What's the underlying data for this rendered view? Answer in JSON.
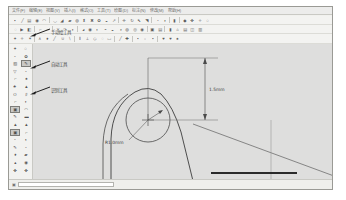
{
  "window": {
    "title": "CAD Drawing Window"
  },
  "menubar": {
    "items": [
      {
        "label": "文件(F)",
        "name": "menu-file"
      },
      {
        "label": "编辑(E)",
        "name": "menu-edit"
      },
      {
        "label": "视图(V)",
        "name": "menu-view"
      },
      {
        "label": "插入(I)",
        "name": "menu-insert"
      },
      {
        "label": "格式(O)",
        "name": "menu-format"
      },
      {
        "label": "工具(T)",
        "name": "menu-tools"
      },
      {
        "label": "绘图(D)",
        "name": "menu-draw"
      },
      {
        "label": "标注(N)",
        "name": "menu-dimension"
      },
      {
        "label": "修改(M)",
        "name": "menu-modify"
      },
      {
        "label": "帮助(H)",
        "name": "menu-help"
      }
    ]
  },
  "toolbars": {
    "row1": [
      {
        "icon": "▪",
        "name": "point-tool"
      },
      {
        "icon": "╱",
        "name": "line-tool"
      },
      {
        "icon": "▤",
        "name": "rectangle-tool"
      },
      {
        "icon": "◉",
        "name": "circle-tool"
      },
      {
        "icon": "◠",
        "name": "arc-tool"
      },
      {
        "sep": true
      },
      {
        "icon": "◡",
        "name": "spline-tool"
      },
      {
        "icon": "◢",
        "name": "polygon-tool"
      },
      {
        "icon": "▰",
        "name": "polyline-tool"
      },
      {
        "icon": "◍",
        "name": "ellipse-tool"
      },
      {
        "icon": "⬍",
        "name": "vertical-line-tool"
      },
      {
        "icon": "✖",
        "name": "delete-tool"
      },
      {
        "icon": "✿",
        "name": "pattern-tool"
      },
      {
        "icon": "◒",
        "name": "half-fill-tool"
      },
      {
        "icon": "↗",
        "name": "extend-tool"
      },
      {
        "sep": true
      },
      {
        "icon": "✛",
        "name": "move-tool"
      },
      {
        "icon": "↻",
        "name": "rotate-tool"
      },
      {
        "icon": "⬉",
        "name": "mirror-tool"
      },
      {
        "icon": "◥",
        "name": "scale-tool"
      },
      {
        "sep": true
      },
      {
        "icon": "◔",
        "name": "trim-tool"
      },
      {
        "icon": "◑",
        "name": "offset-tool"
      },
      {
        "sep": true
      },
      {
        "icon": "▮",
        "name": "array-tool"
      },
      {
        "sep": true
      },
      {
        "icon": "◆",
        "name": "block-tool"
      },
      {
        "icon": "✤",
        "name": "hatch-tool"
      },
      {
        "icon": "✧",
        "name": "gradient-tool"
      },
      {
        "icon": "○",
        "name": "region-tool"
      }
    ],
    "row2": [
      {
        "icon": "◌",
        "name": "new-file-button"
      },
      {
        "icon": "▶",
        "name": "open-file-button"
      },
      {
        "icon": "◧",
        "name": "save-file-button"
      },
      {
        "sep": true
      },
      {
        "icon": "⌐",
        "name": "undo-button"
      },
      {
        "icon": "¬",
        "name": "redo-button"
      },
      {
        "sep": true
      },
      {
        "icon": "✕",
        "name": "cut-button"
      },
      {
        "icon": "↷",
        "name": "copy-button"
      },
      {
        "icon": "◗",
        "name": "paste-button"
      },
      {
        "sep": true
      },
      {
        "icon": "◕",
        "name": "zoom-window-tool"
      },
      {
        "icon": "◉",
        "name": "zoom-extents-tool"
      },
      {
        "icon": "◐",
        "name": "zoom-previous-tool"
      },
      {
        "icon": "◓",
        "name": "zoom-in-tool"
      },
      {
        "icon": "◒",
        "name": "zoom-out-tool"
      },
      {
        "icon": "◑",
        "name": "pan-tool"
      },
      {
        "icon": "◍",
        "name": "orbit-tool"
      },
      {
        "icon": "◎",
        "name": "regen-tool"
      },
      {
        "icon": "◉",
        "name": "redraw-tool"
      },
      {
        "sep": true
      },
      {
        "icon": "▣",
        "name": "layer-manager-button"
      },
      {
        "icon": "▤",
        "name": "linetype-button"
      },
      {
        "sep": true
      },
      {
        "icon": "▮",
        "name": "properties-button"
      },
      {
        "icon": "⌂",
        "name": "home-view-button"
      },
      {
        "icon": "▤",
        "name": "grid-button"
      },
      {
        "icon": "◫",
        "name": "snap-button"
      },
      {
        "icon": "▥",
        "name": "ortho-button"
      }
    ],
    "row3": [
      {
        "icon": "✦",
        "name": "dim-linear-tool"
      },
      {
        "icon": "✧",
        "name": "dim-aligned-tool"
      },
      {
        "icon": "✶",
        "name": "dim-angular-tool"
      },
      {
        "sep": true
      },
      {
        "icon": "∧",
        "name": "chamfer-tool"
      },
      {
        "icon": "♦",
        "name": "fillet-tool"
      },
      {
        "icon": "╱",
        "name": "leader-tool"
      },
      {
        "icon": "∪",
        "name": "union-tool"
      },
      {
        "icon": "∖",
        "name": "subtract-tool"
      },
      {
        "sep": true
      },
      {
        "icon": "⫴",
        "name": "parallel-tool"
      },
      {
        "icon": "⟂",
        "name": "perpendicular-tool"
      },
      {
        "icon": "◇",
        "name": "diamond-tool"
      },
      {
        "icon": "◌",
        "name": "center-mark-tool"
      },
      {
        "icon": "▭",
        "name": "box-tool"
      },
      {
        "sep": true
      },
      {
        "icon": "╱",
        "name": "section-tool"
      },
      {
        "icon": "✚",
        "name": "add-node-tool"
      },
      {
        "sep": true
      },
      {
        "icon": "▪",
        "name": "node-tool"
      },
      {
        "icon": "▫",
        "name": "vertex-tool"
      },
      {
        "icon": "▪",
        "name": "handle-tool"
      },
      {
        "sep": true
      },
      {
        "icon": "♥",
        "name": "favorite-tool"
      },
      {
        "icon": "♥",
        "name": "favorite-alt-tool"
      },
      {
        "icon": "♠",
        "name": "symbol-tool"
      }
    ]
  },
  "left_toolbar": {
    "buttons": [
      {
        "icon": "✦",
        "name": "lt-select-tool"
      },
      {
        "icon": "○",
        "name": "lt-circle-tool"
      },
      {
        "icon": "◔",
        "name": "lt-arc-tool"
      },
      {
        "icon": "✿",
        "name": "lt-pattern-tool"
      },
      {
        "icon": "▨",
        "name": "lt-hatch-tool"
      },
      {
        "icon": "✎",
        "name": "lt-sketch-tool",
        "active": true
      },
      {
        "icon": "▽",
        "name": "lt-taper-tool"
      },
      {
        "icon": "◔",
        "name": "lt-sector-tool"
      },
      {
        "icon": "⌐",
        "name": "lt-corner-tool"
      },
      {
        "icon": "♠",
        "name": "lt-symbol-tool"
      },
      {
        "icon": "♣",
        "name": "lt-node-tool"
      },
      {
        "icon": "▲",
        "name": "lt-triangle-tool"
      },
      {
        "icon": "O",
        "name": "lt-ellipse-tool"
      },
      {
        "icon": "♯",
        "name": "lt-grid-tool"
      },
      {
        "icon": "⌐",
        "name": "lt-bracket-tool"
      },
      {
        "icon": "◗",
        "name": "lt-offset-tool"
      },
      {
        "icon": "▣",
        "name": "lt-manual-tool",
        "active": true
      },
      {
        "icon": "◠",
        "name": "lt-curve-tool"
      },
      {
        "icon": "✎",
        "name": "lt-pen-tool"
      },
      {
        "icon": "▬",
        "name": "lt-line-tool"
      },
      {
        "icon": "▲",
        "name": "lt-cone-tool"
      },
      {
        "icon": "▲",
        "name": "lt-pyramid-tool"
      },
      {
        "icon": "▣",
        "name": "lt-auto-tool",
        "active": true
      },
      {
        "icon": "⌐",
        "name": "lt-angle-tool"
      },
      {
        "icon": "◔",
        "name": "lt-quarter-tool"
      },
      {
        "icon": "◖",
        "name": "lt-half-tool"
      },
      {
        "icon": "✎",
        "name": "lt-draw-tool"
      },
      {
        "icon": "◔",
        "name": "lt-fillet2-tool"
      },
      {
        "icon": "♦",
        "name": "lt-point-tool"
      },
      {
        "icon": "▰",
        "name": "lt-rect2-tool"
      },
      {
        "icon": "▴",
        "name": "lt-up-tool"
      },
      {
        "icon": "◉",
        "name": "lt-target-tool"
      },
      {
        "icon": "✤",
        "name": "lt-star-tool"
      },
      {
        "icon": "✤",
        "name": "lt-snowflake-tool"
      }
    ]
  },
  "annotations": [
    {
      "label": "手动绘工具",
      "name": "callout-manual-tool"
    },
    {
      "label": "自动工具",
      "name": "callout-auto-tool"
    },
    {
      "label": "识别工具",
      "name": "callout-recognize-tool"
    }
  ],
  "drawing": {
    "dimension_vertical": "1.5mm",
    "dimension_radius": "R1.0mm"
  },
  "statusbar": {
    "icon": "▣",
    "value": ""
  },
  "colors": {
    "window_bg": "#f1f1ee",
    "canvas_bg": "#dededd",
    "toolbar_bg": "#f3f3f1",
    "border": "#9a9a95",
    "shape_stroke": "#3b3b3b",
    "dim_line": "#555555"
  }
}
